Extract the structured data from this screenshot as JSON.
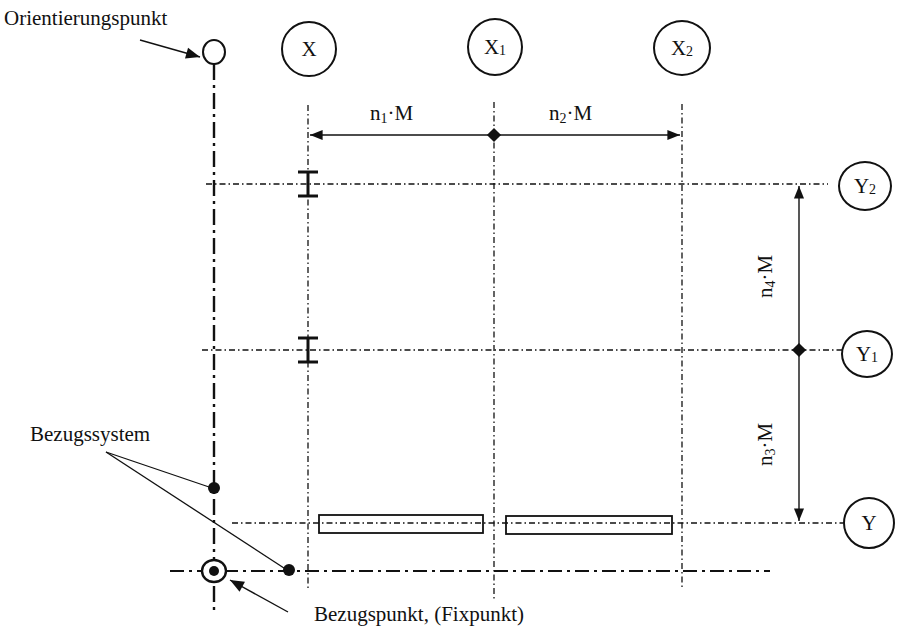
{
  "diagram": {
    "type": "Achsraster / reference grid layout",
    "labels": {
      "orientation_point": "Orientierungspunkt",
      "reference_system": "Bezugssystem",
      "reference_point": "Bezugspunkt, (Fixpunkt)"
    },
    "axes_x": [
      {
        "name": "X",
        "sub": ""
      },
      {
        "name": "X",
        "sub": "1"
      },
      {
        "name": "X",
        "sub": "2"
      }
    ],
    "axes_y": [
      {
        "name": "Y",
        "sub": "2"
      },
      {
        "name": "Y",
        "sub": "1"
      },
      {
        "name": "Y",
        "sub": ""
      }
    ],
    "dimensions": {
      "d1": {
        "n": "n",
        "sub": "1",
        "rest": "·M"
      },
      "d2": {
        "n": "n",
        "sub": "2",
        "rest": "·M"
      },
      "d3": {
        "n": "n",
        "sub": "3",
        "rest": "·M"
      },
      "d4": {
        "n": "n",
        "sub": "4",
        "rest": "·M"
      }
    },
    "colors": {
      "ink": "#111111",
      "background": "#ffffff"
    }
  }
}
